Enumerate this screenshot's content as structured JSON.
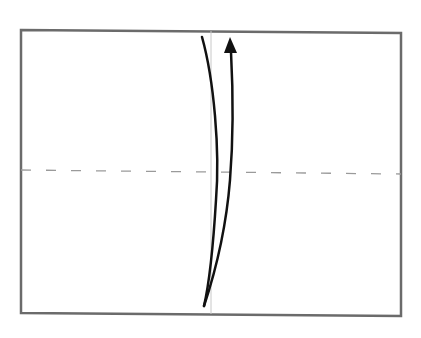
{
  "diagram": {
    "type": "origami-fold-step",
    "colors": {
      "background": "#ffffff",
      "paper_border": "#6b6b6b",
      "dashed_line": "#9a9a9a",
      "center_line": "#c8c8c8",
      "arrow": "#111111"
    },
    "paper": {
      "corners": {
        "top_left": [
          21,
          30
        ],
        "top_right": [
          401,
          33
        ],
        "bottom_right": [
          401,
          316
        ],
        "bottom_left": [
          21,
          313
        ]
      },
      "stroke_width": 2.5
    },
    "fold_line": {
      "style": "dashed",
      "start": [
        21,
        170
      ],
      "end": [
        401,
        174
      ],
      "dash_length": 10,
      "gap_length": 15
    },
    "center_line": {
      "start": [
        211,
        31
      ],
      "end": [
        211,
        314
      ]
    },
    "arrow": {
      "direction": "up",
      "left_curve": "M 202 37 C 214 80, 220 150, 216 200 C 213 250, 210 280, 204 306",
      "right_curve": "M 204 306 C 216 270, 226 230, 230 180 C 234 130, 233 90, 231 52",
      "head_tip": [
        230,
        37
      ]
    }
  }
}
